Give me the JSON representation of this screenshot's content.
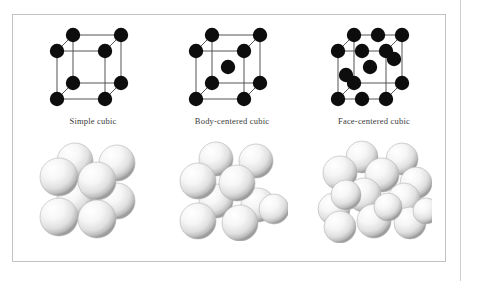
{
  "figure": {
    "type": "diagram",
    "border_color": "#c2c2c2",
    "background_color": "#ffffff",
    "atom_color": "#0d0d0d",
    "edge_color": "#555555",
    "sphere_color": "#f2f2f2",
    "sphere_shadow_color": "#9a9a9a",
    "panels": [
      {
        "id": "simple-cubic",
        "caption": "Simple cubic",
        "atom_count": 8,
        "description": "Ball-and-stick unit cell with atoms at the eight cube corners only.",
        "corner_atoms": 8,
        "body_center_atoms": 0,
        "face_center_atoms": 0,
        "packing_spheres": 8
      },
      {
        "id": "body-centered-cubic",
        "caption": "Body-centered cubic",
        "atom_count": 9,
        "description": "Ball-and-stick unit cell with atoms at the eight cube corners plus one at the body center.",
        "corner_atoms": 8,
        "body_center_atoms": 1,
        "face_center_atoms": 0,
        "packing_spheres": 9
      },
      {
        "id": "face-centered-cubic",
        "caption": "Face-centered cubic",
        "atom_count": 14,
        "description": "Ball-and-stick unit cell with atoms at the eight cube corners plus one at the center of each of the six faces.",
        "corner_atoms": 8,
        "body_center_atoms": 0,
        "face_center_atoms": 6,
        "packing_spheres": 14
      }
    ]
  }
}
